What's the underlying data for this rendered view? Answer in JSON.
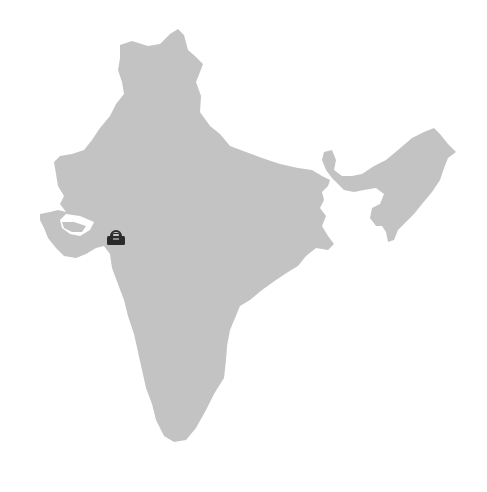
{
  "map": {
    "title": "India",
    "region_fill": "#c3c3c3",
    "background": "#ffffff",
    "regions": [
      {
        "name": "mainland"
      },
      {
        "name": "north-east"
      }
    ]
  },
  "markers": [
    {
      "name": "marker",
      "icon": "briefcase-icon",
      "color": "#2b2b2b",
      "x": 106,
      "y": 228
    }
  ]
}
